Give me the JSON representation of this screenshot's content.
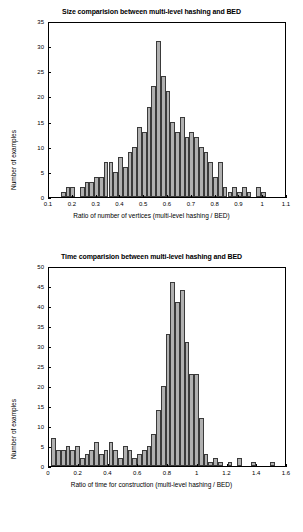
{
  "chart_data": [
    {
      "type": "bar",
      "title": "Size comparision between multi-level hashing and BED",
      "xlabel": "Ratio of number of vertices (multi-level hashing / BED)",
      "ylabel": "Number of examples",
      "xlim": [
        0.1,
        1.1
      ],
      "ylim": [
        0,
        35
      ],
      "xticks": [
        "0.1",
        "0.2",
        "0.3",
        "0.4",
        "0.5",
        "0.6",
        "0.7",
        "0.8",
        "0.9",
        "1",
        "1.1"
      ],
      "yticks": [
        "0",
        "5",
        "10",
        "15",
        "20",
        "25",
        "30",
        "35"
      ],
      "grid": false,
      "bin_width": 0.02,
      "bins": [
        {
          "x": 0.16,
          "v": 1
        },
        {
          "x": 0.18,
          "v": 2
        },
        {
          "x": 0.2,
          "v": 2
        },
        {
          "x": 0.22,
          "v": 0
        },
        {
          "x": 0.24,
          "v": 2
        },
        {
          "x": 0.26,
          "v": 3
        },
        {
          "x": 0.28,
          "v": 3
        },
        {
          "x": 0.3,
          "v": 4
        },
        {
          "x": 0.32,
          "v": 4
        },
        {
          "x": 0.34,
          "v": 7
        },
        {
          "x": 0.36,
          "v": 7
        },
        {
          "x": 0.38,
          "v": 5
        },
        {
          "x": 0.4,
          "v": 8
        },
        {
          "x": 0.42,
          "v": 6
        },
        {
          "x": 0.44,
          "v": 9
        },
        {
          "x": 0.46,
          "v": 10
        },
        {
          "x": 0.48,
          "v": 14
        },
        {
          "x": 0.5,
          "v": 13
        },
        {
          "x": 0.52,
          "v": 18
        },
        {
          "x": 0.54,
          "v": 22
        },
        {
          "x": 0.56,
          "v": 31
        },
        {
          "x": 0.58,
          "v": 24
        },
        {
          "x": 0.6,
          "v": 21
        },
        {
          "x": 0.62,
          "v": 15
        },
        {
          "x": 0.64,
          "v": 13
        },
        {
          "x": 0.66,
          "v": 16
        },
        {
          "x": 0.68,
          "v": 12
        },
        {
          "x": 0.7,
          "v": 13
        },
        {
          "x": 0.72,
          "v": 12
        },
        {
          "x": 0.74,
          "v": 10
        },
        {
          "x": 0.76,
          "v": 9
        },
        {
          "x": 0.78,
          "v": 7
        },
        {
          "x": 0.8,
          "v": 4
        },
        {
          "x": 0.82,
          "v": 7
        },
        {
          "x": 0.84,
          "v": 2
        },
        {
          "x": 0.86,
          "v": 1
        },
        {
          "x": 0.88,
          "v": 2
        },
        {
          "x": 0.9,
          "v": 1
        },
        {
          "x": 0.92,
          "v": 2
        },
        {
          "x": 0.94,
          "v": 1
        },
        {
          "x": 0.96,
          "v": 0
        },
        {
          "x": 0.98,
          "v": 2
        },
        {
          "x": 1.0,
          "v": 1
        }
      ]
    },
    {
      "type": "bar",
      "title": "Time comparision between multi-level hashing and BED",
      "xlabel": "Ratio of time for construction (multi-level hashing / BED)",
      "ylabel": "Number of examples",
      "xlim": [
        0.0,
        1.6
      ],
      "ylim": [
        0,
        50
      ],
      "xticks": [
        "0",
        "0.2",
        "0.4",
        "0.6",
        "0.8",
        "1",
        "1.2",
        "1.4",
        "1.6"
      ],
      "yticks": [
        "0",
        "5",
        "10",
        "15",
        "20",
        "25",
        "30",
        "35",
        "40",
        "45",
        "50"
      ],
      "grid": false,
      "bin_width": 0.032,
      "bins": [
        {
          "x": 0.032,
          "v": 7
        },
        {
          "x": 0.064,
          "v": 4
        },
        {
          "x": 0.096,
          "v": 4
        },
        {
          "x": 0.128,
          "v": 5
        },
        {
          "x": 0.16,
          "v": 4
        },
        {
          "x": 0.192,
          "v": 5
        },
        {
          "x": 0.224,
          "v": 2
        },
        {
          "x": 0.256,
          "v": 3
        },
        {
          "x": 0.288,
          "v": 4
        },
        {
          "x": 0.32,
          "v": 6
        },
        {
          "x": 0.352,
          "v": 3
        },
        {
          "x": 0.384,
          "v": 4
        },
        {
          "x": 0.416,
          "v": 6
        },
        {
          "x": 0.448,
          "v": 4
        },
        {
          "x": 0.48,
          "v": 2
        },
        {
          "x": 0.512,
          "v": 5
        },
        {
          "x": 0.544,
          "v": 4
        },
        {
          "x": 0.576,
          "v": 2
        },
        {
          "x": 0.608,
          "v": 3
        },
        {
          "x": 0.64,
          "v": 4
        },
        {
          "x": 0.672,
          "v": 5
        },
        {
          "x": 0.704,
          "v": 8
        },
        {
          "x": 0.736,
          "v": 14
        },
        {
          "x": 0.768,
          "v": 20
        },
        {
          "x": 0.8,
          "v": 33
        },
        {
          "x": 0.832,
          "v": 46
        },
        {
          "x": 0.864,
          "v": 41
        },
        {
          "x": 0.896,
          "v": 44
        },
        {
          "x": 0.928,
          "v": 31
        },
        {
          "x": 0.96,
          "v": 23
        },
        {
          "x": 0.992,
          "v": 23
        },
        {
          "x": 1.024,
          "v": 12
        },
        {
          "x": 1.056,
          "v": 3
        },
        {
          "x": 1.088,
          "v": 1
        },
        {
          "x": 1.12,
          "v": 2
        },
        {
          "x": 1.152,
          "v": 1
        },
        {
          "x": 1.184,
          "v": 0
        },
        {
          "x": 1.216,
          "v": 1
        },
        {
          "x": 1.248,
          "v": 0
        },
        {
          "x": 1.28,
          "v": 2
        },
        {
          "x": 1.312,
          "v": 0
        },
        {
          "x": 1.344,
          "v": 0
        },
        {
          "x": 1.376,
          "v": 1
        },
        {
          "x": 1.408,
          "v": 0
        },
        {
          "x": 1.44,
          "v": 0
        },
        {
          "x": 1.472,
          "v": 0
        },
        {
          "x": 1.504,
          "v": 1
        }
      ]
    }
  ],
  "style": {
    "bar_fill": "#b0b0b0",
    "bar_edge": "#3a3a3a",
    "axis_color": "#000000",
    "background": "#ffffff"
  }
}
